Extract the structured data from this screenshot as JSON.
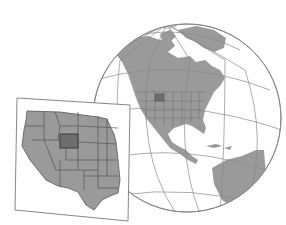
{
  "map": {
    "type": "locator-map-illustration",
    "globe": {
      "region_shown": "North America",
      "graticule": true,
      "land_color": "#9a9a9a",
      "ocean_color": "#ffffff",
      "line_color": "#8a8a8a"
    },
    "inset": {
      "region_shown": "Western United States",
      "highlighted_state": "Wyoming",
      "land_color": "#9a9a9a",
      "highlight_color": "#6e6e6e",
      "border_color": "#555555"
    }
  }
}
